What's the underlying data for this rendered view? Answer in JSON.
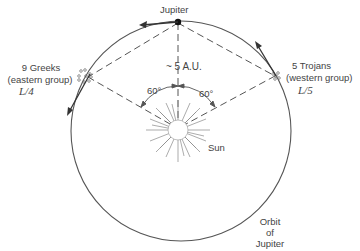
{
  "diagram": {
    "jupiter_label": "Jupiter",
    "distance_label": "~ 5 A.U.",
    "angle_left": "60°",
    "angle_right": "60°",
    "sun_label": "Sun",
    "greeks": {
      "line1": "9 Greeks",
      "line2": "(eastern group)",
      "point": "L/4"
    },
    "trojans": {
      "line1": "5 Trojans",
      "line2": "(western group)",
      "point": "L/5"
    },
    "orbit_label": {
      "line1": "Orbit",
      "line2": "of",
      "line3": "Jupiter"
    },
    "colors": {
      "line": "#444444",
      "background": "#ffffff"
    }
  }
}
